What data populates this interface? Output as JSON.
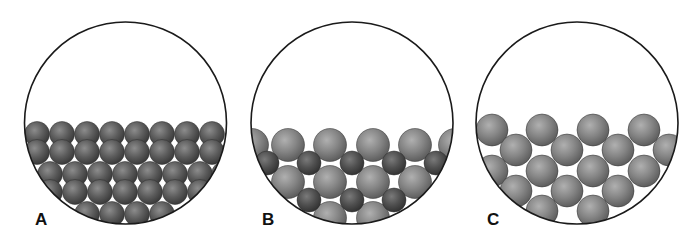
{
  "figure": {
    "colors": {
      "sphere_large": "#8a8a8a",
      "sphere_dark": "#5a5a5a",
      "sphere_small": "#4e4e4e",
      "outline": "#1a1a1a",
      "background": "#ffffff"
    },
    "panels": [
      {
        "label": "A",
        "circle": {
          "cx": 125.5,
          "cy": 123,
          "r": 101
        },
        "label_pos": {
          "x": 35,
          "y": 211
        },
        "sphere_radius": 12.5,
        "sphere_color": "dark",
        "spheres": [
          [
            37,
            134
          ],
          [
            62,
            134
          ],
          [
            87,
            134
          ],
          [
            112,
            134
          ],
          [
            137,
            134
          ],
          [
            162,
            134
          ],
          [
            187,
            134
          ],
          [
            212,
            134
          ],
          [
            37,
            152
          ],
          [
            62,
            152
          ],
          [
            87,
            152
          ],
          [
            112,
            152
          ],
          [
            137,
            152
          ],
          [
            162,
            152
          ],
          [
            187,
            152
          ],
          [
            212,
            152
          ],
          [
            24,
            174
          ],
          [
            50,
            174
          ],
          [
            75,
            174
          ],
          [
            100,
            174
          ],
          [
            125,
            174
          ],
          [
            150,
            174
          ],
          [
            175,
            174
          ],
          [
            200,
            174
          ],
          [
            224,
            174
          ],
          [
            24,
            192
          ],
          [
            50,
            192
          ],
          [
            75,
            192
          ],
          [
            100,
            192
          ],
          [
            125,
            192
          ],
          [
            150,
            192
          ],
          [
            175,
            192
          ],
          [
            200,
            192
          ],
          [
            224,
            192
          ],
          [
            87,
            214
          ],
          [
            112,
            214
          ],
          [
            137,
            214
          ],
          [
            162,
            214
          ]
        ]
      },
      {
        "label": "B",
        "circle": {
          "cx": 352,
          "cy": 123,
          "r": 101
        },
        "label_pos": {
          "x": 262,
          "y": 211
        },
        "large_radius": 16.5,
        "small_radius": 12,
        "large_spheres": [
          [
            252,
            145
          ],
          [
            288,
            145
          ],
          [
            330,
            145
          ],
          [
            373,
            145
          ],
          [
            415,
            145
          ],
          [
            455,
            145
          ],
          [
            288,
            182
          ],
          [
            330,
            182
          ],
          [
            373,
            182
          ],
          [
            415,
            182
          ],
          [
            330,
            218
          ],
          [
            373,
            218
          ]
        ],
        "small_spheres": [
          [
            267,
            163
          ],
          [
            309,
            163
          ],
          [
            352,
            163
          ],
          [
            394,
            163
          ],
          [
            436,
            163
          ],
          [
            309,
            200
          ],
          [
            352,
            200
          ],
          [
            394,
            200
          ]
        ]
      },
      {
        "label": "C",
        "circle": {
          "cx": 577,
          "cy": 123,
          "r": 101
        },
        "label_pos": {
          "x": 487,
          "y": 211
        },
        "sphere_radius": 16,
        "spheres": [
          [
            492,
            130
          ],
          [
            542,
            130
          ],
          [
            593,
            130
          ],
          [
            644,
            130
          ],
          [
            516,
            150
          ],
          [
            567,
            150
          ],
          [
            618,
            150
          ],
          [
            669,
            150
          ],
          [
            492,
            171
          ],
          [
            542,
            171
          ],
          [
            593,
            171
          ],
          [
            644,
            171
          ],
          [
            516,
            191
          ],
          [
            567,
            191
          ],
          [
            618,
            191
          ],
          [
            542,
            211
          ],
          [
            593,
            211
          ]
        ]
      }
    ]
  }
}
